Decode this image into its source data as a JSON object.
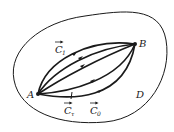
{
  "diagram": {
    "title": "",
    "region_label": "D",
    "points": {
      "A": {
        "label": "A"
      },
      "B": {
        "label": "B"
      }
    },
    "curves": [
      {
        "id": "C1",
        "label": "C",
        "subscript": "1",
        "vector": true
      },
      {
        "id": "Ctau",
        "label": "C",
        "subscript": "τ",
        "vector": true
      },
      {
        "id": "C0",
        "label": "C",
        "subscript": "0",
        "vector": true
      }
    ],
    "colors": {
      "stroke": "#1a1a1a",
      "background": "#ffffff"
    }
  }
}
